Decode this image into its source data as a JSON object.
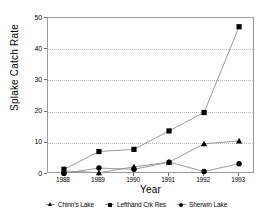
{
  "chart_data": {
    "type": "line",
    "title": "",
    "xlabel": "Year",
    "ylabel": "Splake Catch Rate",
    "categories": [
      "1988",
      "1989",
      "1990",
      "1991",
      "1992",
      "1993"
    ],
    "x": [
      1988,
      1989,
      1990,
      1991,
      1992,
      1993
    ],
    "xlim": [
      1987.6,
      1993.4
    ],
    "ylim": [
      0,
      50
    ],
    "yticks": [
      0,
      10,
      20,
      30,
      40,
      50
    ],
    "grid": "horizontal-dotted",
    "legend_position": "bottom",
    "series": [
      {
        "name": "Chinn's Lake",
        "marker": "triangle",
        "color": "#000000",
        "values": [
          1.0,
          0.4,
          2.3,
          3.8,
          9.7,
          10.6
        ]
      },
      {
        "name": "Lefthand Crk Res",
        "marker": "square",
        "color": "#000000",
        "values": [
          1.5,
          7.2,
          7.9,
          13.8,
          19.7,
          47.2
        ]
      },
      {
        "name": "Sherwin Lake",
        "marker": "circle",
        "color": "#000000",
        "values": [
          0.2,
          1.9,
          1.5,
          3.8,
          0.8,
          3.3
        ]
      }
    ]
  },
  "axes": {
    "y_tick_labels": [
      "0",
      "10",
      "20",
      "30",
      "40",
      "50"
    ],
    "x_tick_labels": [
      "1988",
      "1989",
      "1990",
      "1991",
      "1992",
      "1993"
    ],
    "y_axis_title": "Splake Catch Rate",
    "x_axis_title": "Year"
  },
  "legend": {
    "items": [
      {
        "label": "Chinn's Lake",
        "marker": "triangle-icon"
      },
      {
        "label": "Lefthand Crk Res",
        "marker": "square-icon"
      },
      {
        "label": "Sherwin Lake",
        "marker": "circle-icon"
      }
    ]
  },
  "style": {
    "line_color": "#8e8e8e",
    "marker_color": "#000000",
    "grid_color": "#b9b9b9",
    "frame_color": "#9a9a9a",
    "background": "#ffffff"
  }
}
